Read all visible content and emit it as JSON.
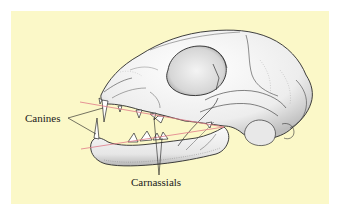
{
  "figure": {
    "background_color": "#fbf8c8",
    "labels": {
      "canines": "Canines",
      "carnassials": "Carnassials"
    },
    "colors": {
      "bite_lines": "#e07a88",
      "leader_lines": "#1a1a1a",
      "bone_fill": "#fafafa",
      "bone_shading": "#c8c8c8",
      "outline": "#2a2a2a"
    }
  }
}
